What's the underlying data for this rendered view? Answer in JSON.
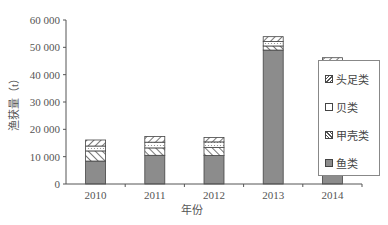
{
  "chart_data": {
    "type": "bar",
    "stacked": true,
    "title": "",
    "xlabel": "年份",
    "ylabel": "渔获量（t）",
    "ylim": [
      0,
      60000
    ],
    "yticks": [
      "0",
      "10 000",
      "20 000",
      "30 000",
      "40 000",
      "50 000",
      "60 000"
    ],
    "categories": [
      "2010",
      "2011",
      "2012",
      "2013",
      "2014"
    ],
    "series": [
      {
        "name": "鱼类",
        "pattern": "solid-gray",
        "values": [
          8400,
          10500,
          10400,
          49000,
          41000
        ]
      },
      {
        "name": "甲壳类",
        "pattern": "backslash-hatch",
        "values": [
          3700,
          2700,
          3000,
          1500,
          1300
        ]
      },
      {
        "name": "贝类",
        "pattern": "dotted",
        "values": [
          1800,
          2100,
          2000,
          1600,
          2000
        ]
      },
      {
        "name": "头足类",
        "pattern": "slash-hatch",
        "values": [
          2200,
          2100,
          1600,
          1800,
          1900
        ]
      }
    ],
    "legend_position": "right",
    "grid": false
  },
  "legend": {
    "items": [
      {
        "label": "头足类",
        "pattern": "slash-hatch"
      },
      {
        "label": "贝类",
        "pattern": "dotted"
      },
      {
        "label": "甲壳类",
        "pattern": "backslash-hatch"
      },
      {
        "label": "鱼类",
        "pattern": "solid-gray"
      }
    ]
  },
  "colors": {
    "fish": "#8c8c8c",
    "outline": "#444444"
  }
}
